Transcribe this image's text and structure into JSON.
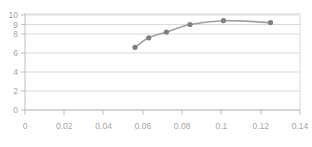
{
  "chart_data": {
    "type": "line",
    "title": "",
    "subtitle": "",
    "xlabel": "",
    "ylabel": "",
    "xlim": [
      0,
      0.14
    ],
    "ylim": [
      0,
      10
    ],
    "grid": true,
    "grid_axis": "y",
    "legend": false,
    "legend_position": "none",
    "markers": true,
    "marker_shape": "circle",
    "series": [
      {
        "name": "",
        "x": [
          0.056,
          0.063,
          0.072,
          0.084,
          0.101,
          0.125
        ],
        "y": [
          6.6,
          7.6,
          8.2,
          9.0,
          9.4,
          9.2
        ]
      }
    ],
    "x_ticks": [
      0,
      0.02,
      0.04,
      0.06,
      0.08,
      0.1,
      0.12,
      0.14
    ],
    "x_tick_labels": [
      "0",
      "0.02",
      "0.04",
      "0.06",
      "0.08",
      "0.1",
      "0.12",
      "0.14"
    ],
    "y_ticks": [
      0,
      2,
      4,
      6,
      8,
      9,
      10
    ],
    "y_tick_labels": [
      "0",
      "2",
      "4",
      "6",
      "8",
      "9",
      "10"
    ],
    "colors": {
      "line": "#a0a0a0",
      "marker": "#808080",
      "grid": "#d9d9d9",
      "axis": "#bfbfbf",
      "tick_text": "#a6a6a6",
      "background": "#ffffff"
    }
  }
}
